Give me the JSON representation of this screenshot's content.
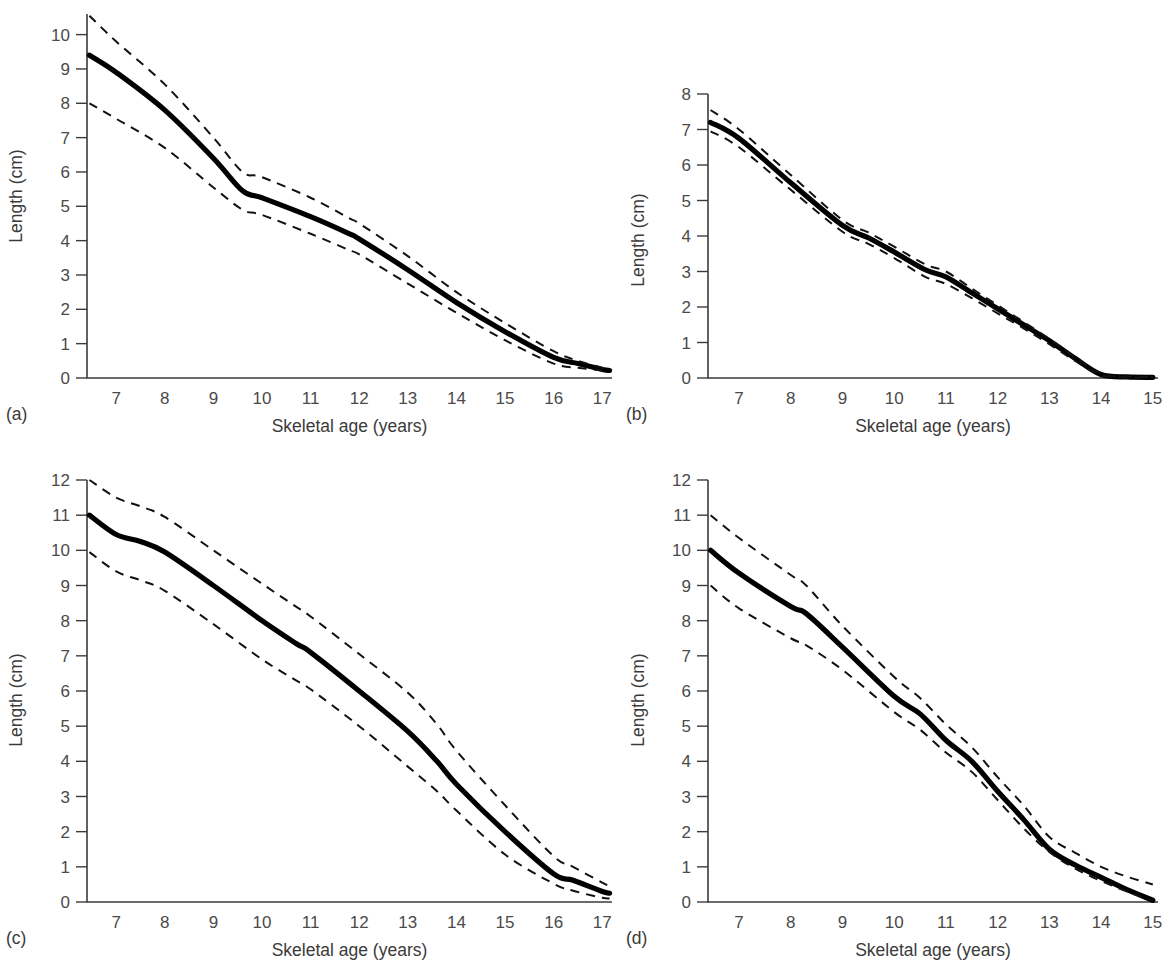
{
  "figure": {
    "axis_title_y": "Length (cm)",
    "axis_title_x": "Skeletal age (years)",
    "panel_tags": [
      "(a)",
      "(b)",
      "(c)",
      "(d)"
    ],
    "line_color": "#000000",
    "axis_color": "#3b3b3b",
    "tick_label_color": "#4a4a4a",
    "background": "#ffffff"
  },
  "chart_data": [
    {
      "id": "a",
      "type": "line",
      "panel_label": "(a)",
      "title": "",
      "xlabel": "Skeletal age (years)",
      "ylabel": "Length (cm)",
      "xlim": [
        6.4,
        17.2
      ],
      "ylim": [
        0,
        10.6
      ],
      "xticks": [
        7,
        8,
        9,
        10,
        11,
        12,
        13,
        14,
        15,
        16,
        17
      ],
      "yticks": [
        0,
        1,
        2,
        3,
        4,
        5,
        6,
        7,
        8,
        9,
        10
      ],
      "grid": false,
      "legend": "none",
      "x": [
        6.45,
        7,
        8,
        9,
        9.6,
        10,
        11,
        11.8,
        12,
        13,
        14,
        15,
        16,
        16.5,
        17,
        17.15
      ],
      "series": [
        {
          "name": "mean",
          "style": "solid",
          "values": [
            9.4,
            8.9,
            7.8,
            6.4,
            5.45,
            5.25,
            4.7,
            4.2,
            4.05,
            3.15,
            2.2,
            1.35,
            0.6,
            0.42,
            0.25,
            0.22
          ]
        },
        {
          "name": "upper (+1 SD)",
          "style": "dashed",
          "values": [
            10.55,
            9.8,
            8.55,
            7.0,
            6.0,
            5.85,
            5.25,
            4.65,
            4.5,
            3.55,
            2.5,
            1.6,
            0.78,
            0.5,
            0.3,
            0.28
          ]
        },
        {
          "name": "lower (-1 SD)",
          "style": "dashed",
          "values": [
            8.0,
            7.55,
            6.7,
            5.55,
            4.9,
            4.75,
            4.2,
            3.72,
            3.6,
            2.75,
            1.9,
            1.1,
            0.42,
            0.3,
            0.22,
            0.2
          ]
        }
      ]
    },
    {
      "id": "b",
      "type": "line",
      "panel_label": "(b)",
      "title": "",
      "xlabel": "Skeletal age (years)",
      "ylabel": "Length (cm)",
      "xlim": [
        6.4,
        15.1
      ],
      "ylim": [
        0,
        8
      ],
      "xticks": [
        7,
        8,
        9,
        10,
        11,
        12,
        13,
        14,
        15
      ],
      "yticks": [
        0,
        1,
        2,
        3,
        4,
        5,
        6,
        7,
        8
      ],
      "grid": false,
      "legend": "none",
      "x": [
        6.45,
        7,
        8,
        9,
        9.5,
        10,
        10.6,
        11,
        11.5,
        12,
        12.5,
        13,
        13.5,
        14,
        14.5,
        15
      ],
      "series": [
        {
          "name": "mean",
          "style": "solid",
          "values": [
            7.2,
            6.75,
            5.5,
            4.3,
            3.95,
            3.55,
            3.05,
            2.85,
            2.4,
            1.95,
            1.5,
            1.05,
            0.55,
            0.1,
            0.03,
            0.02
          ]
        },
        {
          "name": "upper (+1 SD)",
          "style": "dashed",
          "values": [
            7.55,
            7.0,
            5.72,
            4.45,
            4.1,
            3.7,
            3.2,
            3.0,
            2.52,
            2.05,
            1.58,
            1.1,
            0.58,
            0.12,
            0.04,
            0.03
          ]
        },
        {
          "name": "lower (-1 SD)",
          "style": "dashed",
          "values": [
            6.95,
            6.5,
            5.3,
            4.12,
            3.78,
            3.38,
            2.85,
            2.65,
            2.25,
            1.82,
            1.4,
            0.95,
            0.48,
            0.08,
            0.02,
            0.02
          ]
        }
      ]
    },
    {
      "id": "c",
      "type": "line",
      "panel_label": "(c)",
      "title": "",
      "xlabel": "Skeletal age (years)",
      "ylabel": "Length (cm)",
      "xlim": [
        6.4,
        17.2
      ],
      "ylim": [
        0,
        12
      ],
      "xticks": [
        7,
        8,
        9,
        10,
        11,
        12,
        13,
        14,
        15,
        16,
        17
      ],
      "yticks": [
        0,
        1,
        2,
        3,
        4,
        5,
        6,
        7,
        8,
        9,
        10,
        11,
        12
      ],
      "grid": false,
      "legend": "none",
      "x": [
        6.45,
        7,
        7.5,
        8,
        9,
        10,
        10.7,
        11,
        12,
        13,
        13.6,
        14,
        15,
        16,
        16.4,
        17,
        17.15
      ],
      "series": [
        {
          "name": "mean",
          "style": "solid",
          "values": [
            11.0,
            10.45,
            10.25,
            9.95,
            9.0,
            8.0,
            7.35,
            7.1,
            6.0,
            4.85,
            4.0,
            3.35,
            2.0,
            0.8,
            0.62,
            0.3,
            0.25
          ]
        },
        {
          "name": "upper (+1 SD)",
          "style": "dashed",
          "values": [
            12.0,
            11.5,
            11.25,
            10.95,
            10.0,
            9.05,
            8.4,
            8.12,
            7.05,
            5.95,
            5.05,
            4.3,
            2.75,
            1.3,
            1.0,
            0.55,
            0.45
          ]
        },
        {
          "name": "lower (-1 SD)",
          "style": "dashed",
          "values": [
            9.95,
            9.4,
            9.15,
            8.85,
            7.9,
            6.9,
            6.3,
            6.05,
            5.0,
            3.85,
            3.15,
            2.6,
            1.35,
            0.52,
            0.32,
            0.12,
            0.1
          ]
        }
      ]
    },
    {
      "id": "d",
      "type": "line",
      "panel_label": "(d)",
      "title": "",
      "xlabel": "Skeletal age (years)",
      "ylabel": "Length (cm)",
      "xlim": [
        6.4,
        15.1
      ],
      "ylim": [
        0,
        12
      ],
      "xticks": [
        7,
        8,
        9,
        10,
        11,
        12,
        13,
        14,
        15
      ],
      "yticks": [
        0,
        1,
        2,
        3,
        4,
        5,
        6,
        7,
        8,
        9,
        10,
        11,
        12
      ],
      "grid": false,
      "legend": "none",
      "x": [
        6.45,
        7,
        8,
        8.3,
        9,
        10,
        10.5,
        11,
        11.5,
        12,
        12.5,
        13,
        13.5,
        14,
        14.5,
        15
      ],
      "series": [
        {
          "name": "mean",
          "style": "solid",
          "values": [
            10.0,
            9.35,
            8.4,
            8.2,
            7.25,
            5.85,
            5.35,
            4.6,
            4.0,
            3.15,
            2.35,
            1.5,
            1.05,
            0.7,
            0.35,
            0.05
          ]
        },
        {
          "name": "upper (+1 SD)",
          "style": "dashed",
          "values": [
            11.0,
            10.35,
            9.3,
            9.0,
            7.85,
            6.4,
            5.8,
            5.05,
            4.4,
            3.55,
            2.75,
            1.85,
            1.4,
            1.0,
            0.72,
            0.5
          ]
        },
        {
          "name": "lower (-1 SD)",
          "style": "dashed",
          "values": [
            9.0,
            8.35,
            7.5,
            7.3,
            6.6,
            5.4,
            4.9,
            4.25,
            3.7,
            2.9,
            2.1,
            1.42,
            0.95,
            0.6,
            0.3,
            0.04
          ]
        }
      ]
    }
  ]
}
